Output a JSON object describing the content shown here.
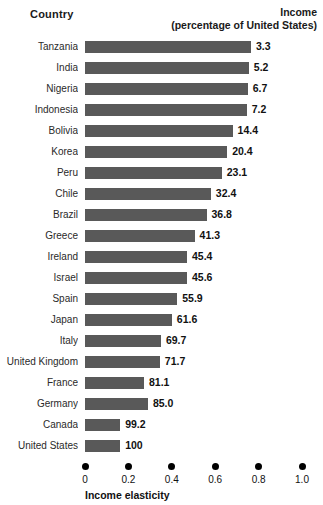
{
  "header": {
    "country_label": "Country",
    "income_line1": "Income",
    "income_line2": "(percentage of United States)"
  },
  "axis": {
    "title": "Income elasticity",
    "ticks": [
      "0",
      "0.2",
      "0.4",
      "0.6",
      "0.8",
      "1.0"
    ]
  },
  "style": {
    "bar_color": "#595959",
    "background": "#ffffff",
    "text_color": "#111111"
  },
  "chart_data": {
    "type": "bar",
    "orientation": "horizontal",
    "title": "",
    "xlabel": "Income elasticity",
    "ylabel": "Country",
    "xlim": [
      0,
      1.0
    ],
    "xticks": [
      0,
      0.2,
      0.4,
      0.6,
      0.8,
      1.0
    ],
    "grid": false,
    "legend": null,
    "value_label_note": "Numbers at bar ends are income as a percentage of the United States; bar length encodes income elasticity.",
    "categories": [
      "Tanzania",
      "India",
      "Nigeria",
      "Indonesia",
      "Bolivia",
      "Korea",
      "Peru",
      "Chile",
      "Brazil",
      "Greece",
      "Ireland",
      "Israel",
      "Spain",
      "Japan",
      "Italy",
      "United Kingdom",
      "France",
      "Germany",
      "Canada",
      "United States"
    ],
    "income_percent_of_us": [
      "3.3",
      "5.2",
      "6.7",
      "7.2",
      "14.4",
      "20.4",
      "23.1",
      "32.4",
      "36.8",
      "41.3",
      "45.4",
      "45.6",
      "55.9",
      "61.6",
      "69.7",
      "71.7",
      "81.1",
      "85.0",
      "99.2",
      "100"
    ],
    "values": [
      0.765,
      0.755,
      0.75,
      0.745,
      0.68,
      0.655,
      0.63,
      0.58,
      0.56,
      0.505,
      0.47,
      0.47,
      0.425,
      0.4,
      0.35,
      0.345,
      0.272,
      0.29,
      0.162,
      0.162
    ]
  }
}
